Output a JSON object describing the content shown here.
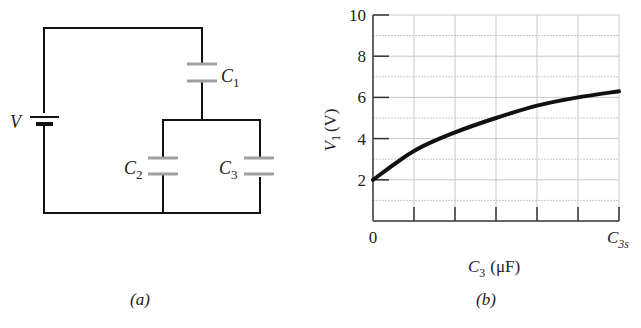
{
  "figure_a": {
    "caption": "(a)",
    "battery_label": "V",
    "capacitors": [
      {
        "name": "C",
        "sub": "1"
      },
      {
        "name": "C",
        "sub": "2"
      },
      {
        "name": "C",
        "sub": "3"
      }
    ]
  },
  "figure_b": {
    "caption": "(b)",
    "ylabel_main": "V",
    "ylabel_sub": "1",
    "ylabel_unit": "(V)",
    "xlabel_main": "C",
    "xlabel_sub": "3",
    "xlabel_unit": "(μF)",
    "x_origin_label": "0",
    "x_end_label_main": "C",
    "x_end_label_sub": "3s",
    "y_ticks": [
      "2",
      "4",
      "6",
      "8",
      "10"
    ]
  },
  "colors": {
    "wire": "#111111",
    "capacitor_plate": "#a0a0a0",
    "grid": "#c8c8c8",
    "curve": "#111111"
  },
  "chart_data": {
    "type": "line",
    "title": "",
    "xlabel": "C3 (μF)",
    "ylabel": "V1 (V)",
    "x_tick_labels": [
      "0",
      "C3s"
    ],
    "y_tick_labels": [
      "2",
      "4",
      "6",
      "8",
      "10"
    ],
    "ylim": [
      0,
      10
    ],
    "xlim": [
      0,
      1
    ],
    "grid": true,
    "x_gridlines": 6,
    "y_grid_step": 1,
    "series": [
      {
        "name": "V1",
        "x": [
          0,
          0.1667,
          0.3333,
          0.5,
          0.6667,
          0.8333,
          1.0
        ],
        "values": [
          2.0,
          3.4,
          4.3,
          5.0,
          5.6,
          6.0,
          6.3
        ]
      }
    ]
  }
}
